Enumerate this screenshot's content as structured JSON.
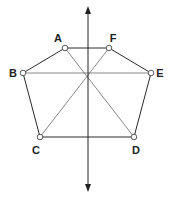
{
  "diagram": {
    "type": "hexagon-with-symmetry-axis",
    "vertices": [
      {
        "id": "A",
        "label": "A"
      },
      {
        "id": "F",
        "label": "F"
      },
      {
        "id": "E",
        "label": "E"
      },
      {
        "id": "D",
        "label": "D"
      },
      {
        "id": "C",
        "label": "C"
      },
      {
        "id": "B",
        "label": "B"
      }
    ],
    "edges": [
      [
        "A",
        "F"
      ],
      [
        "F",
        "E"
      ],
      [
        "E",
        "D"
      ],
      [
        "D",
        "C"
      ],
      [
        "C",
        "B"
      ],
      [
        "B",
        "A"
      ]
    ],
    "diagonals": [
      [
        "A",
        "D"
      ],
      [
        "F",
        "C"
      ],
      [
        "B",
        "E"
      ]
    ],
    "axis": {
      "orientation": "vertical",
      "arrows": "both"
    }
  }
}
